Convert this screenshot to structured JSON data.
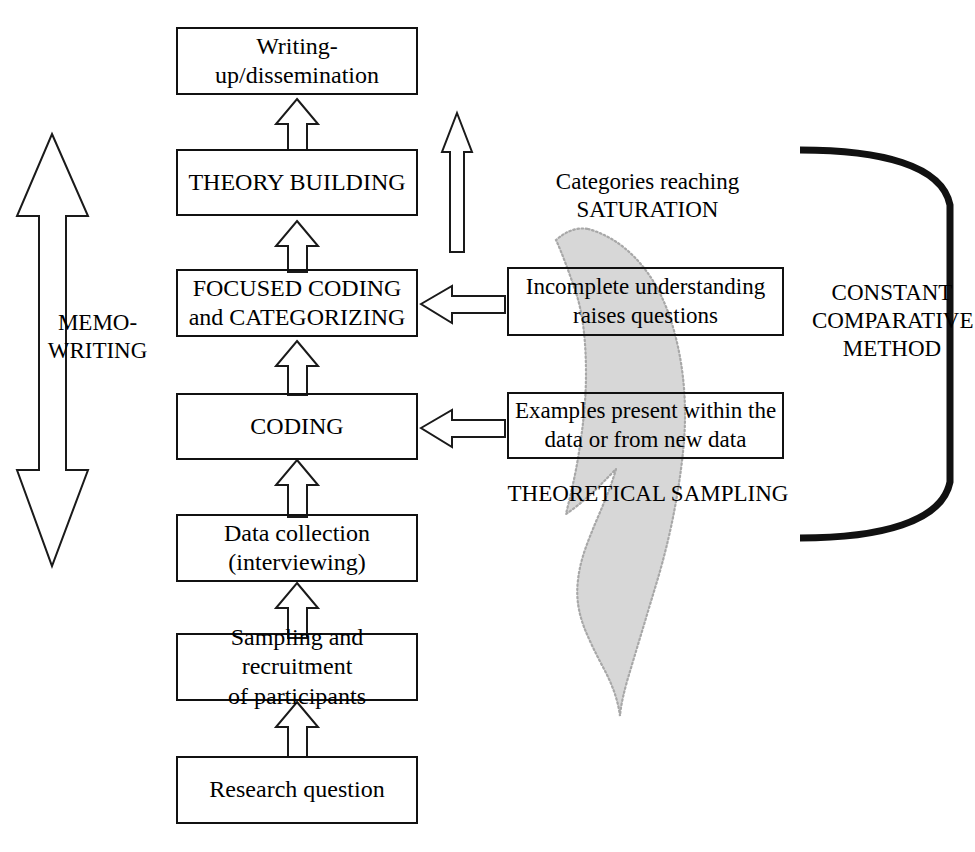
{
  "diagram": {
    "accent_color": "#d7d7d7",
    "line_color": "#111111"
  },
  "flow_boxes": [
    {
      "id": "writing-up",
      "label": "Writing-up/dissemination"
    },
    {
      "id": "theory-building",
      "label": "THEORY BUILDING"
    },
    {
      "id": "focused-coding",
      "label": "FOCUSED CODING\nand CATEGORIZING"
    },
    {
      "id": "coding",
      "label": "CODING"
    },
    {
      "id": "data-collection",
      "label": "Data collection\n(interviewing)"
    },
    {
      "id": "sampling",
      "label": "Sampling and recruitment\nof participants"
    },
    {
      "id": "research-question",
      "label": "Research question"
    }
  ],
  "side_boxes": [
    {
      "id": "incomplete-understanding",
      "label": "Incomplete understanding\nraises questions"
    },
    {
      "id": "examples-present",
      "label": "Examples present within the\ndata or from new data"
    }
  ],
  "labels": {
    "memo_writing": "MEMO-\nWRITING",
    "categories_saturation": "Categories reaching\nSATURATION",
    "theoretical_sampling": "THEORETICAL SAMPLING",
    "constant_comparative_method": "CONSTANT\nCOMPARATIVE\nMETHOD"
  },
  "arrows": {
    "memo_writing_arrow": "double-headed-vertical-arrow",
    "feedback_arrow": "tall-up-arrow",
    "step_arrows": "up-arrow",
    "side_arrows": "left-arrow",
    "saturation_arrow": "curved-shaded-arrow"
  }
}
